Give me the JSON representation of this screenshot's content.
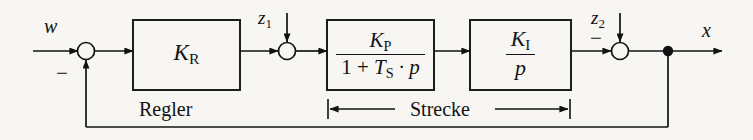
{
  "diagram": {
    "type": "control-loop-block-diagram",
    "signals": {
      "reference_label": "w",
      "output_label": "x",
      "disturbance_1_base": "z",
      "disturbance_1_sub": "1",
      "disturbance_2_base": "z",
      "disturbance_2_sub": "2",
      "minus_feedback": "−",
      "minus_z2": "−"
    },
    "blocks": [
      {
        "name": "controller-block",
        "kind": "gain",
        "base": "K",
        "sub": "R",
        "numerator_base": "",
        "numerator_sub": "",
        "denominator": ""
      },
      {
        "name": "plant-lag-block",
        "kind": "fraction",
        "numerator_base": "K",
        "numerator_sub": "P",
        "denominator_prefix": "1 + ",
        "denominator_base": "T",
        "denominator_sub": "S",
        "denominator_suffix": " · p"
      },
      {
        "name": "plant-integrator-block",
        "kind": "fraction",
        "numerator_base": "K",
        "numerator_sub": "I",
        "denominator_plain": "p"
      }
    ],
    "sections": {
      "controller_label": "Regler",
      "plant_label": "Strecke"
    }
  }
}
